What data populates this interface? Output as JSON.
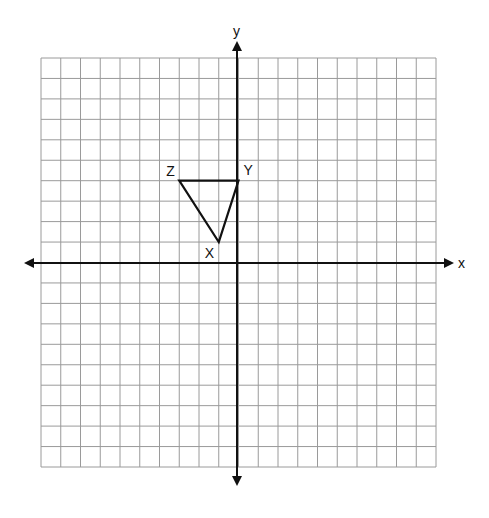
{
  "diagram": {
    "type": "coordinate-grid",
    "grid": {
      "x_min": -10,
      "x_max": 10,
      "y_min": -10,
      "y_max": 10,
      "cells": 20
    },
    "axes": {
      "x_label": "x",
      "y_label": "y"
    },
    "triangle": {
      "vertices": [
        {
          "name": "X",
          "x": -1,
          "y": 1
        },
        {
          "name": "Y",
          "x": 0,
          "y": 4
        },
        {
          "name": "Z",
          "x": -3,
          "y": 4
        }
      ]
    },
    "colors": {
      "grid": "#9a9a9a",
      "axis": "#111111",
      "shape": "#111111",
      "background": "#ffffff"
    }
  }
}
